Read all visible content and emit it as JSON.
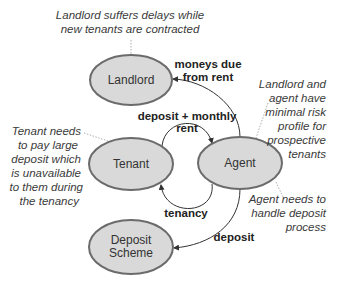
{
  "nodes": {
    "landlord": {
      "label": "Landlord"
    },
    "tenant": {
      "label": "Tenant"
    },
    "agent": {
      "label": "Agent"
    },
    "deposit_scheme": {
      "line1": "Deposit",
      "line2": "Scheme"
    }
  },
  "edges": {
    "agent_to_landlord": {
      "line1": "moneys due",
      "line2": "from rent"
    },
    "tenant_to_agent": {
      "line1": "deposit + monthly",
      "line2": "rent"
    },
    "agent_to_tenant": {
      "label": "tenancy"
    },
    "agent_to_deposit_scheme": {
      "label": "deposit"
    }
  },
  "notes": {
    "landlord": {
      "lines": [
        "Landlord suffers delays while",
        "new tenants are contracted"
      ]
    },
    "tenant": {
      "lines": [
        "Tenant needs",
        "to pay large",
        "deposit which",
        "is unavailable",
        "to them during",
        "the tenancy"
      ]
    },
    "agent_risk": {
      "lines": [
        "Landlord and",
        "agent have",
        "minimal risk",
        "profile for",
        "prospective",
        "tenants"
      ]
    },
    "agent_deposit": {
      "lines": [
        "Agent needs to",
        "handle deposit",
        "process"
      ]
    }
  },
  "colors": {
    "node_fill": "#d9d9d9",
    "node_stroke": "#6b6b6b",
    "edge": "#333333",
    "leader": "#9a9a9a"
  }
}
